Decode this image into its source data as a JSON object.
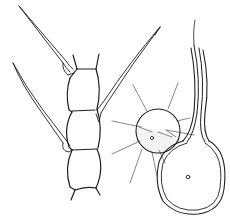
{
  "figure": {
    "type": "scientific line illustration",
    "background": "#ffffff",
    "ink_color": "#1f1f1f",
    "panels": [
      {
        "id": "filament",
        "description": "chain of three barrel-shaped cells with long bristles",
        "cell_count": 3,
        "bristle_count": 3
      },
      {
        "id": "spherical-cell",
        "description": "round cell with radiating fine spines and stippled lower half",
        "spine_count": 9
      },
      {
        "id": "flask-cell",
        "description": "flask-shaped cell with long stalk and double outline",
        "has_nucleus_dot": true
      }
    ]
  }
}
